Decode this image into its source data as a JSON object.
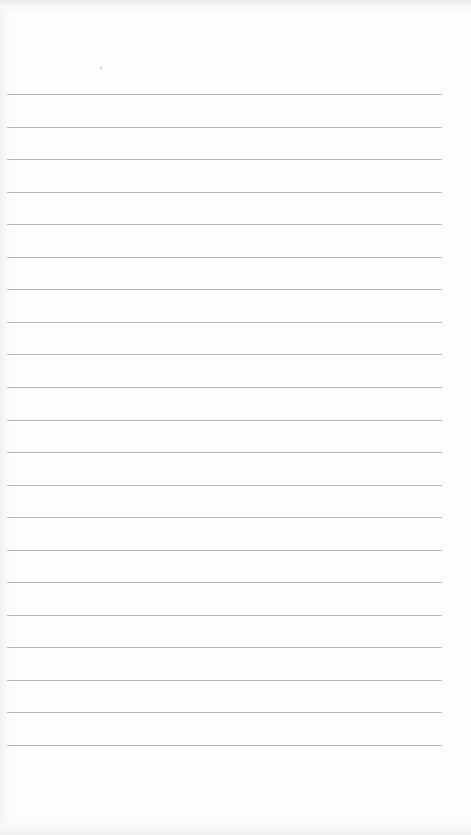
{
  "page": {
    "type": "lined-paper",
    "background_color": "#fdfdfd",
    "rule_color": "#a9a9a9"
  },
  "rules": {
    "count": 21,
    "first_y": 94,
    "spacing": 32.55,
    "left_x": 7,
    "width": 435
  }
}
